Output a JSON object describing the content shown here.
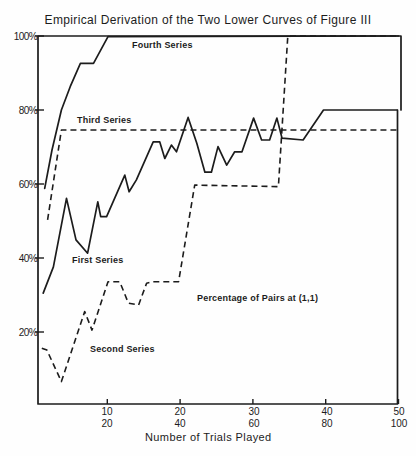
{
  "chart_data": {
    "type": "line",
    "title": "Empirical Derivation of the Two Lower Curves of Figure III",
    "xlabel": "Number of Trials Played",
    "ylabel": "",
    "xlim": [
      0,
      50
    ],
    "ylim": [
      0,
      100
    ],
    "grid": false,
    "legend": "inline labels",
    "xticks": [
      10,
      20,
      30,
      40,
      50
    ],
    "xtick_labels": [
      "10",
      "20",
      "30",
      "40",
      "50"
    ],
    "xtick_labels_secondary": [
      "20",
      "40",
      "60",
      "80",
      "100"
    ],
    "yticks": [
      20,
      40,
      60,
      80,
      100
    ],
    "ytick_labels": [
      "20%",
      "40%",
      "60%",
      "80%",
      "100%"
    ],
    "annotations": [
      {
        "text": "Percentage of Pairs at (1,1)"
      }
    ],
    "series": [
      {
        "name": "First Series",
        "style": "solid",
        "x": [
          1.2,
          2.6,
          4.4,
          5.7,
          7.3,
          8.7,
          9.1,
          9.9,
          12.4,
          13.0,
          14.0,
          16.3,
          17.2,
          17.9,
          18.8,
          19.5,
          21.1,
          22.3,
          23.4,
          24.3,
          25.2,
          26.4,
          27.5,
          28.5,
          30.1,
          31.2,
          32.3,
          33.3,
          34.0,
          36.9,
          39.7,
          49.8
        ],
        "y": [
          30.5,
          37.6,
          56.1,
          44.9,
          41.3,
          55.2,
          51.2,
          51.2,
          62.4,
          57.9,
          61.1,
          71.4,
          71.4,
          66.9,
          70.5,
          68.7,
          78.0,
          71.0,
          63.2,
          63.2,
          70.1,
          65.1,
          68.7,
          68.7,
          77.8,
          71.9,
          71.9,
          77.8,
          72.4,
          71.9,
          80.0,
          80.0
        ]
      },
      {
        "name": "Second Series",
        "style": "dashed",
        "x": [
          1.0,
          1.7,
          3.7,
          6.9,
          7.9,
          10.1,
          11.7,
          12.9,
          14.3,
          15.4,
          16.3,
          19.8,
          22.0,
          33.5,
          34.8,
          50.0
        ],
        "y": [
          15.6,
          15.1,
          6.6,
          25.5,
          20.5,
          33.6,
          33.6,
          27.8,
          27.3,
          33.2,
          33.6,
          33.6,
          59.7,
          59.3,
          100.0,
          100.0
        ]
      },
      {
        "name": "Third Series",
        "style": "dashed",
        "x": [
          1.8,
          3.7,
          49.9
        ],
        "y": [
          50.3,
          74.6,
          74.6
        ]
      },
      {
        "name": "Fourth Series",
        "style": "solid",
        "x": [
          1.4,
          2.4,
          3.7,
          4.9,
          6.3,
          8.1,
          10.1,
          50.0
        ],
        "y": [
          58.8,
          69.2,
          80.0,
          86.3,
          92.6,
          92.6,
          99.8,
          100.0
        ]
      }
    ]
  }
}
